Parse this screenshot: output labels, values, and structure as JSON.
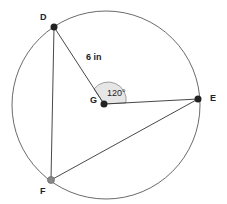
{
  "diagram": {
    "points": {
      "D": {
        "label": "D",
        "x": 54,
        "y": 27
      },
      "E": {
        "label": "E",
        "x": 198,
        "y": 99
      },
      "F": {
        "label": "F",
        "x": 51,
        "y": 180
      },
      "G": {
        "label": "G",
        "x": 104,
        "y": 104
      }
    },
    "radius_label": "6 in",
    "angle_label": "120°",
    "circle": {
      "cx": 106,
      "cy": 105,
      "r": 94
    },
    "colors": {
      "stroke": "#333333",
      "point": "#222222",
      "point_f": "#888888",
      "angle_fill": "#e6e6e6"
    }
  }
}
